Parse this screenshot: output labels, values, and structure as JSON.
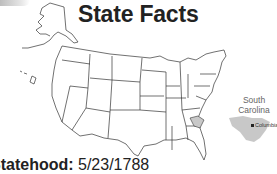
{
  "header": {
    "title": "State Facts"
  },
  "map": {
    "highlighted_state": "South Carolina",
    "highlight_color": "#c8c8c8",
    "outline_color": "#333333"
  },
  "inset": {
    "state_name": "South Carolina",
    "capital": "Columbia",
    "fill_color": "#c8c8c8"
  },
  "facts": {
    "statehood_label": "Statehood:",
    "statehood_value": "5/23/1788"
  }
}
